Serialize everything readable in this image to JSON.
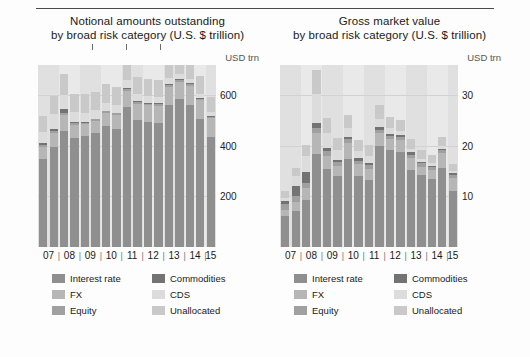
{
  "units": {
    "left": "USD trn",
    "right": "USD trn"
  },
  "panels": [
    {
      "key": "notional",
      "title_line1": "Notional amounts outstanding",
      "title_line2": "by broad risk category (U.S. $ trillion)"
    },
    {
      "key": "gross",
      "title_line1": "Gross market value",
      "title_line2": "by broad risk category (U.S. $ trillion)"
    }
  ],
  "legend": {
    "items": [
      {
        "label": "Interest rate",
        "color": "#8f8f8f"
      },
      {
        "label": "Commodities",
        "color": "#737373"
      },
      {
        "label": "FX",
        "color": "#b6b6b6"
      },
      {
        "label": "CDS",
        "color": "#dcdcdc"
      },
      {
        "label": "Equity",
        "color": "#a0a0a0"
      },
      {
        "label": "Unallocated",
        "color": "#c9c9c9"
      }
    ]
  },
  "chart_data": [
    {
      "type": "bar",
      "stacked": true,
      "title": "Notional amounts outstanding by broad risk category (U.S. $ trillion)",
      "xlabel": "",
      "ylabel": "USD trn",
      "ylim": [
        0,
        720
      ],
      "yticks": [
        200,
        400,
        600
      ],
      "grid": true,
      "legend_position": "bottom",
      "x_group_labels": [
        "07",
        "08",
        "09",
        "10",
        "11",
        "12",
        "13",
        "14",
        "15"
      ],
      "x": [
        "07H1",
        "07H2",
        "08H1",
        "08H2",
        "09H1",
        "09H2",
        "10H1",
        "10H2",
        "11H1",
        "11H2",
        "12H1",
        "12H2",
        "13H1",
        "13H2",
        "14H1",
        "14H2",
        "15H1"
      ],
      "series": [
        {
          "name": "Interest rate",
          "values": [
            347,
            394,
            459,
            433,
            438,
            450,
            478,
            465,
            554,
            504,
            494,
            492,
            561,
            584,
            563,
            505,
            435
          ]
        },
        {
          "name": "FX",
          "values": [
            48,
            56,
            63,
            50,
            48,
            49,
            53,
            58,
            65,
            63,
            67,
            67,
            73,
            70,
            75,
            75,
            74
          ]
        },
        {
          "name": "Equity",
          "values": [
            10,
            8,
            10,
            6,
            6,
            6,
            6,
            6,
            6,
            6,
            6,
            6,
            7,
            7,
            7,
            7,
            7
          ]
        },
        {
          "name": "Commodities",
          "values": [
            8,
            9,
            13,
            4,
            4,
            3,
            3,
            3,
            3,
            3,
            3,
            3,
            3,
            2,
            2,
            2,
            2
          ]
        },
        {
          "name": "CDS",
          "values": [
            43,
            58,
            57,
            42,
            36,
            33,
            30,
            30,
            32,
            29,
            27,
            25,
            24,
            21,
            19,
            16,
            15
          ]
        },
        {
          "name": "Unallocated",
          "values": [
            61,
            71,
            81,
            70,
            72,
            73,
            75,
            70,
            72,
            69,
            67,
            66,
            75,
            76,
            75,
            70,
            62
          ]
        }
      ]
    },
    {
      "type": "bar",
      "stacked": true,
      "title": "Gross market value by broad risk category (U.S. $ trillion)",
      "xlabel": "",
      "ylabel": "USD trn",
      "ylim": [
        0,
        36
      ],
      "yticks": [
        10,
        20,
        30
      ],
      "grid": true,
      "legend_position": "bottom",
      "x_group_labels": [
        "07",
        "08",
        "09",
        "10",
        "11",
        "12",
        "13",
        "14",
        "15"
      ],
      "x": [
        "07H1",
        "07H2",
        "08H1",
        "08H2",
        "09H1",
        "09H2",
        "10H1",
        "10H2",
        "11H1",
        "11H2",
        "12H1",
        "12H2",
        "13H1",
        "13H2",
        "14H1",
        "14H2",
        "15H1"
      ],
      "series": [
        {
          "name": "Interest rate",
          "values": [
            6.1,
            7.2,
            9.3,
            18.4,
            15.5,
            14.0,
            17.5,
            14.0,
            13.2,
            20.0,
            19.1,
            18.8,
            15.2,
            14.2,
            13.5,
            15.6,
            11.1
          ]
        },
        {
          "name": "FX",
          "values": [
            1.3,
            1.8,
            2.3,
            4.1,
            2.5,
            2.1,
            3.1,
            2.5,
            2.3,
            2.6,
            2.2,
            2.3,
            2.4,
            1.7,
            1.7,
            2.9,
            2.6
          ]
        },
        {
          "name": "Equity",
          "values": [
            1.1,
            1.1,
            1.1,
            1.1,
            0.9,
            0.7,
            0.7,
            0.6,
            0.7,
            0.6,
            0.6,
            0.6,
            0.7,
            0.7,
            0.6,
            0.6,
            0.6
          ]
        },
        {
          "name": "Commodities",
          "values": [
            0.6,
            1.9,
            2.2,
            1.0,
            0.7,
            0.5,
            0.5,
            0.5,
            0.5,
            0.5,
            0.4,
            0.4,
            0.4,
            0.3,
            0.3,
            0.3,
            0.3
          ]
        },
        {
          "name": "CDS",
          "values": [
            0.7,
            2.0,
            3.2,
            5.7,
            2.9,
            1.8,
            1.7,
            1.4,
            1.3,
            1.6,
            1.2,
            0.9,
            0.7,
            0.6,
            0.6,
            0.6,
            0.5
          ]
        },
        {
          "name": "Unallocated",
          "values": [
            1.3,
            1.6,
            2.0,
            4.8,
            3.1,
            2.4,
            2.7,
            2.2,
            2.1,
            2.8,
            2.3,
            2.1,
            1.9,
            1.6,
            1.5,
            1.8,
            1.4
          ]
        }
      ]
    }
  ]
}
